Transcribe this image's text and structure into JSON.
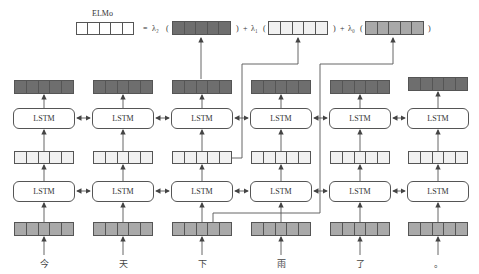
{
  "header": {
    "elmo_label": "ELMo",
    "equals": "=",
    "terms": [
      {
        "coef": "λ₂",
        "open": "(",
        "close": ")",
        "plus": "+",
        "fill": "dark"
      },
      {
        "coef": "λ₁",
        "open": "(",
        "close": ")",
        "plus": "+",
        "fill": "light"
      },
      {
        "coef": "λ₀",
        "open": "(",
        "close": ")",
        "plus": "",
        "fill": "mid"
      }
    ]
  },
  "lstm_label": "LSTM",
  "tokens": [
    "今",
    "天",
    "下",
    "雨",
    "了",
    "。"
  ],
  "colors": {
    "dark_cell": "#6e6e6e",
    "mid_cell": "#a9a9a9",
    "light_cell": "#f1f1f1",
    "line": "#555555"
  },
  "layers": {
    "top_output": "dark",
    "upper_lstm": "LSTM",
    "middle_hidden": "light",
    "lower_lstm": "LSTM",
    "input_embedding": "mid"
  }
}
